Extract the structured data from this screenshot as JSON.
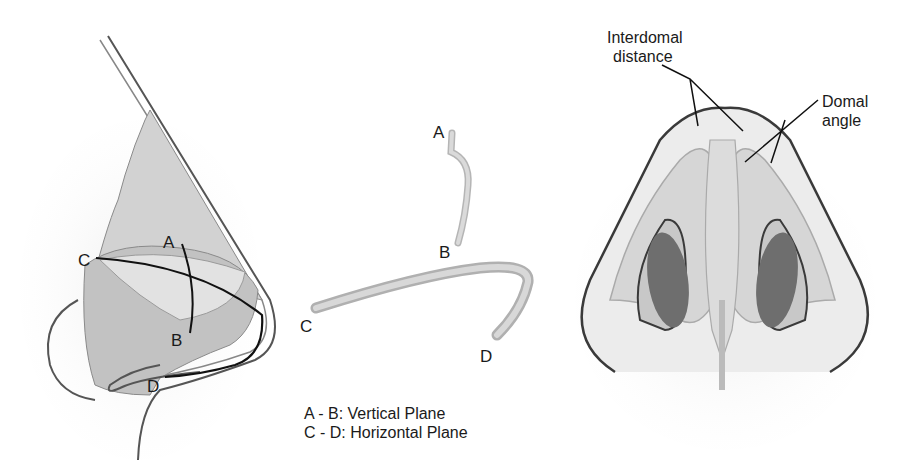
{
  "diagram": {
    "panels": [
      {
        "id": "lateral-view",
        "description": "Lateral view of nose with cartilage planes"
      },
      {
        "id": "isolated-cartilage",
        "description": "Isolated cartilage curves"
      },
      {
        "id": "basal-view",
        "description": "Basal view of nasal tip"
      }
    ],
    "lateral_labels": {
      "a": "A",
      "b": "B",
      "c": "C",
      "d": "D"
    },
    "isolated_labels": {
      "a": "A",
      "b": "B",
      "c": "C",
      "d": "D"
    },
    "legend": {
      "line1": "A - B: Vertical Plane",
      "line2": "C - D: Horizontal Plane"
    },
    "basal_annotations": {
      "interdomal_line1": "Interdomal",
      "interdomal_line2": "distance",
      "domal_line1": "Domal",
      "domal_line2": "angle"
    },
    "colors": {
      "skin": "#e6e6e6",
      "cartilage_light": "#dcdcdc",
      "cartilage_mid": "#c4c4c4",
      "cartilage_dark": "#a8a8a8",
      "nostril": "#6e6e6e",
      "outline": "#3a3a3a",
      "line": "#111111"
    }
  }
}
